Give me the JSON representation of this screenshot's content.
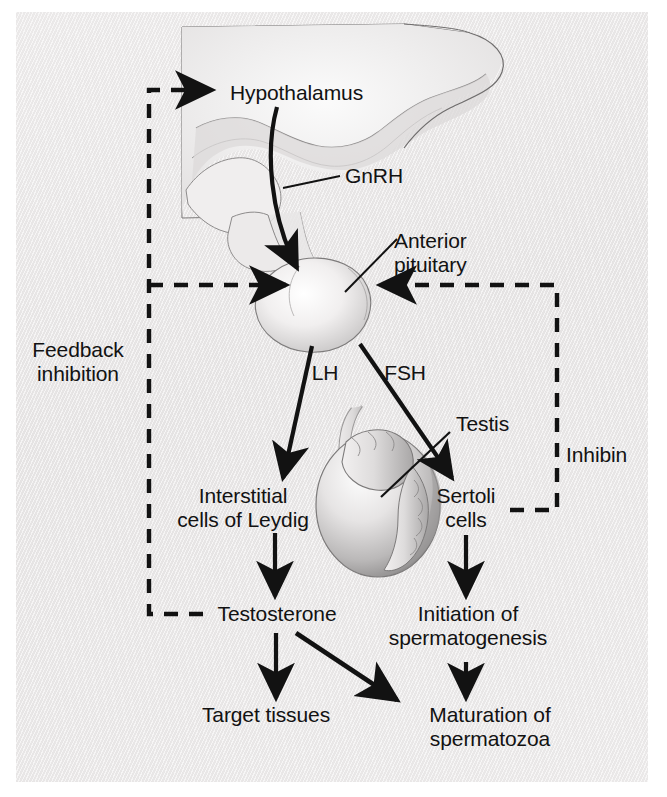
{
  "figure": {
    "type": "biological-flow-diagram",
    "background_color": "#eceaea",
    "ink_color": "#121212"
  },
  "labels": {
    "hypothalamus": "Hypothalamus",
    "gnrh": "GnRH",
    "anterior_pituitary_line1": "Anterior",
    "anterior_pituitary_line2": "pituitary",
    "feedback_line1": "Feedback",
    "feedback_line2": "inhibition",
    "lh": "LH",
    "fsh": "FSH",
    "testis": "Testis",
    "inhibin": "Inhibin",
    "interstitial_line1": "Interstitial",
    "interstitial_line2": "cells of Leydig",
    "sertoli_line1": "Sertoli",
    "sertoli_line2": "cells",
    "testosterone": "Testosterone",
    "initiation_line1": "Initiation of",
    "initiation_line2": "spermatogenesis",
    "target_tissues": "Target tissues",
    "maturation_line1": "Maturation of",
    "maturation_line2": "spermatozoa"
  },
  "nodes": [
    {
      "id": "hypothalamus",
      "label": "Hypothalamus",
      "x": 305,
      "y": 93
    },
    {
      "id": "anterior-pituitary",
      "label": "Anterior pituitary",
      "x": 452,
      "y": 252
    },
    {
      "id": "interstitial-cells-of-leydig",
      "label": "Interstitial cells of Leydig",
      "x": 243,
      "y": 508
    },
    {
      "id": "sertoli-cells",
      "label": "Sertoli cells",
      "x": 465,
      "y": 508
    },
    {
      "id": "testosterone",
      "label": "Testosterone",
      "x": 277,
      "y": 615
    },
    {
      "id": "initiation-of-spermatogenesis",
      "label": "Initiation of spermatogenesis",
      "x": 468,
      "y": 615
    },
    {
      "id": "target-tissues",
      "label": "Target tissues",
      "x": 266,
      "y": 716
    },
    {
      "id": "maturation-of-spermatozoa",
      "label": "Maturation of spermatozoa",
      "x": 490,
      "y": 716
    }
  ],
  "edges": [
    {
      "id": "gnrh-arrow",
      "from": "hypothalamus",
      "to": "anterior-pituitary",
      "label": "GnRH",
      "style": "solid-curved"
    },
    {
      "id": "lh-arrow",
      "from": "anterior-pituitary",
      "to": "interstitial-cells-of-leydig",
      "label": "LH",
      "style": "solid"
    },
    {
      "id": "fsh-arrow",
      "from": "anterior-pituitary",
      "to": "sertoli-cells",
      "label": "FSH",
      "style": "solid"
    },
    {
      "id": "leydig-to-testosterone",
      "from": "interstitial-cells-of-leydig",
      "to": "testosterone",
      "label": "",
      "style": "solid"
    },
    {
      "id": "sertoli-to-initiation",
      "from": "sertoli-cells",
      "to": "initiation-of-spermatogenesis",
      "label": "",
      "style": "solid"
    },
    {
      "id": "testosterone-to-target",
      "from": "testosterone",
      "to": "target-tissues",
      "label": "",
      "style": "solid"
    },
    {
      "id": "testosterone-to-maturation",
      "from": "testosterone",
      "to": "maturation-of-spermatozoa",
      "label": "",
      "style": "solid-diagonal"
    },
    {
      "id": "initiation-to-maturation",
      "from": "initiation-of-spermatogenesis",
      "to": "maturation-of-spermatozoa",
      "label": "",
      "style": "solid"
    },
    {
      "id": "feedback-to-hypothalamus",
      "from": "testosterone",
      "to": "hypothalamus",
      "label": "Feedback inhibition",
      "style": "dashed"
    },
    {
      "id": "feedback-to-pituitary",
      "from": "testosterone",
      "to": "anterior-pituitary",
      "label": "Feedback inhibition",
      "style": "dashed"
    },
    {
      "id": "inhibin-to-pituitary",
      "from": "sertoli-cells",
      "to": "anterior-pituitary",
      "label": "Inhibin",
      "style": "dashed"
    }
  ]
}
